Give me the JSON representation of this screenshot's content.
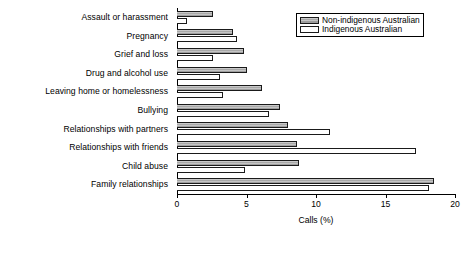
{
  "chart_data": {
    "type": "bar",
    "orientation": "horizontal",
    "title": "",
    "xlabel": "Calls (%)",
    "ylabel": "",
    "xlim": [
      0,
      20
    ],
    "xticks": [
      0,
      5,
      10,
      15,
      20
    ],
    "xtick_labels": [
      "0",
      "5",
      "10",
      "15",
      "20"
    ],
    "grid": false,
    "legend_position": "top-right",
    "categories": [
      "Assault or harassment",
      "Pregnancy",
      "Grief and loss",
      "Drug and alcohol use",
      "Leaving home or homelessness",
      "Bullying",
      "Relationships with partners",
      "Relationships with friends",
      "Child abuse",
      "Family relationships"
    ],
    "series": [
      {
        "name": "Non-indigenous Australian",
        "color": "#b9b9b9",
        "values": [
          2.6,
          4.0,
          4.8,
          5.0,
          6.1,
          7.4,
          8.0,
          8.6,
          8.8,
          18.5
        ]
      },
      {
        "name": "Indigenous Australian",
        "color": "#ffffff",
        "values": [
          0.7,
          4.3,
          2.6,
          3.1,
          3.3,
          6.6,
          11.0,
          17.2,
          4.9,
          18.1
        ]
      }
    ]
  },
  "legend": {
    "entries": [
      {
        "label": "Non-indigenous Australian"
      },
      {
        "label": "Indigenous Australian"
      }
    ]
  }
}
